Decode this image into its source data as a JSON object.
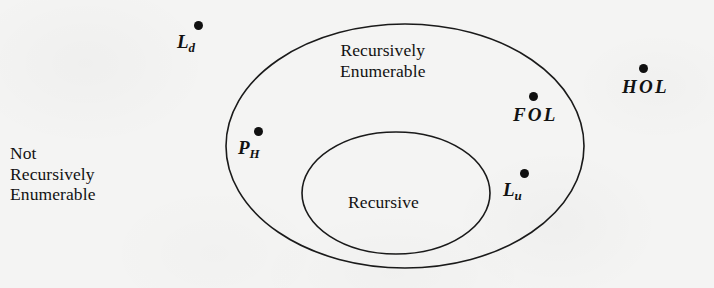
{
  "figure": {
    "background_color": "#f4f4f3",
    "stroke_color": "#1a1a1a",
    "dot_color": "#101010"
  },
  "regions": {
    "outer_region_label_line1": "Recursively",
    "outer_region_label_line2": "Enumerable",
    "inner_region_label": "Recursive",
    "outside_region_label_line1": "Not",
    "outside_region_label_line2": "Recursively",
    "outside_region_label_line3": "Enumerable"
  },
  "points": [
    {
      "id": "Ld",
      "base": "L",
      "sub": "d",
      "spaced": false,
      "dot_x": 198,
      "dot_y": 25,
      "label_x": 177,
      "label_y": 31,
      "region": "not-recursively-enumerable"
    },
    {
      "id": "PH",
      "base": "P",
      "sub": "H",
      "spaced": false,
      "dot_x": 258,
      "dot_y": 131,
      "label_x": 238,
      "label_y": 137,
      "region": "recursively-enumerable"
    },
    {
      "id": "FOL",
      "base": "FOL",
      "sub": "",
      "spaced": true,
      "dot_x": 533,
      "dot_y": 96,
      "label_x": 513,
      "label_y": 104,
      "region": "recursively-enumerable"
    },
    {
      "id": "Lu",
      "base": "L",
      "sub": "u",
      "spaced": false,
      "dot_x": 524,
      "dot_y": 173,
      "label_x": 503,
      "label_y": 179,
      "region": "recursively-enumerable"
    },
    {
      "id": "HOL",
      "base": "HOL",
      "sub": "",
      "spaced": true,
      "dot_x": 643,
      "dot_y": 68,
      "label_x": 622,
      "label_y": 76,
      "region": "not-recursively-enumerable"
    }
  ],
  "ellipses": {
    "outer": {
      "cx": 405,
      "cy": 146,
      "rx": 179,
      "ry": 122
    },
    "inner": {
      "cx": 396,
      "cy": 193,
      "rx": 94,
      "ry": 61
    }
  }
}
